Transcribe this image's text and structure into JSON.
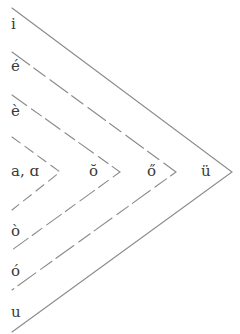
{
  "diagram": {
    "type": "vowel-chevron-diagram",
    "line_color": "#8a8a8a",
    "text_color": "#3a3a3a",
    "left_column": [
      {
        "label": "i",
        "x": 11,
        "y": 17
      },
      {
        "label": "é",
        "x": 11,
        "y": 59
      },
      {
        "label": "è",
        "x": 11,
        "y": 104
      },
      {
        "label": "a, ɑ",
        "x": 11,
        "y": 164
      },
      {
        "label": "ò",
        "x": 11,
        "y": 224
      },
      {
        "label": "ó",
        "x": 11,
        "y": 264
      },
      {
        "label": "u",
        "x": 11,
        "y": 305
      }
    ],
    "middle_row": [
      {
        "label": "ŏ",
        "x": 89,
        "y": 164
      },
      {
        "label": "ő",
        "x": 147,
        "y": 164
      },
      {
        "label": "ü",
        "x": 201,
        "y": 164
      }
    ],
    "chevrons": [
      {
        "name": "outer",
        "top": [
          12,
          8
        ],
        "apex": [
          232,
          172
        ],
        "bottom": [
          12,
          332
        ]
      },
      {
        "name": "second",
        "top": [
          12,
          52
        ],
        "apex": [
          176,
          172
        ],
        "bottom": [
          12,
          290
        ]
      },
      {
        "name": "third",
        "top": [
          12,
          95
        ],
        "apex": [
          120,
          172
        ],
        "bottom": [
          12,
          250
        ]
      },
      {
        "name": "fourth",
        "top": [
          12,
          137
        ],
        "apex": [
          60,
          172
        ],
        "bottom": [
          12,
          210
        ]
      }
    ]
  }
}
